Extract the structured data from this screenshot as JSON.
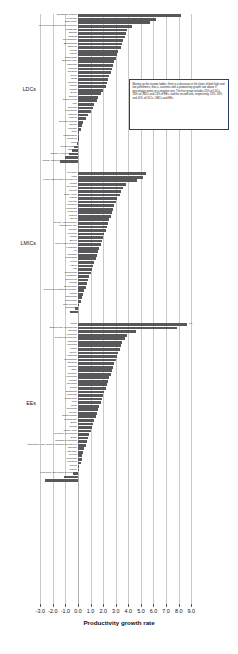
{
  "chart_data": {
    "type": "bar",
    "title": "",
    "xlabel": "Productivity growth rate",
    "ylabel": "",
    "xlim": [
      -3.0,
      9.0
    ],
    "grid": true,
    "orientation": "horizontal",
    "bar_color": "#58585a",
    "tick_labels": [
      "-3.0",
      "-2.0",
      "-1.0",
      "0.0",
      "1.0",
      "2.0",
      "3.0",
      "4.0",
      "5.0",
      "6.0",
      "7.0",
      "8.0",
      "9.0"
    ],
    "ticks": [
      -3,
      -2,
      -1,
      0,
      1,
      2,
      3,
      4,
      5,
      6,
      7,
      8,
      9
    ],
    "groups": [
      {
        "name": "LDCs",
        "categories": [
          "Equatorial Guinea",
          "Myanmar",
          "East Timor",
          "Lao People's Democratic Republic",
          "Cambodia",
          "Bhutan",
          "Uganda",
          "Mozambique",
          "Bangladesh",
          "Ethiopia",
          "Angola",
          "Liberia",
          "Afghanistan",
          "Burkina Faso",
          "Tanzania",
          "Lesotho",
          "Rwanda",
          "Nepal",
          "Chad",
          "Somalia",
          "Sudan",
          "Malawi",
          "Benin",
          "Zambia",
          "Sierra Leone",
          "Mali",
          "Senegal",
          "Mauritania",
          "Gambia",
          "Guinea",
          "Solomon Islands",
          "Eritrea",
          "Vanuatu",
          "Togo",
          "Madagascar",
          "Comoros",
          "Niger",
          "Guinea-Bissau",
          "Burundi",
          "Central African Republic",
          "Haiti",
          "Congo, Democratic Republic of"
        ],
        "values": [
          8.2,
          6.2,
          5.7,
          4.3,
          3.9,
          3.8,
          3.7,
          3.6,
          3.5,
          3.4,
          3.2,
          3.1,
          3.0,
          2.9,
          2.8,
          2.7,
          2.6,
          2.5,
          2.4,
          2.3,
          2.2,
          2.0,
          1.8,
          1.6,
          1.5,
          1.3,
          1.2,
          1.0,
          0.8,
          0.6,
          0.4,
          0.3,
          0.2,
          0.1,
          0.1,
          0.0,
          -0.1,
          -0.3,
          -0.5,
          -0.7,
          -1.0,
          -1.4
        ],
        "value_labels": []
      },
      {
        "name": "LMICs",
        "categories": [
          "Viet Nam",
          "India",
          "Korea, Democratic Republic of",
          "Albania",
          "Sri Lanka",
          "Armenia",
          "Cabo Verde",
          "Ghana",
          "Guyana",
          "Mongolia",
          "Indonesia",
          "Moldova",
          "Nigeria",
          "Egypt",
          "Syrian Arab Republic",
          "Philippines, The",
          "Ukraine",
          "Morocco",
          "Sudan",
          "Bolivia",
          "Papua New Guinea",
          "Honduras",
          "Fiji",
          "Pakistan",
          "Nicaragua",
          "Kenya",
          "Algeria",
          "Iraq",
          "Guatemala",
          "Paraguay",
          "Cameroon",
          "Jordan",
          "El Salvador",
          "Occupied Palestinian Territory",
          "Congo",
          "Swaziland",
          "Cameroon",
          "Côte d'Ivoire",
          "Zimbabwe",
          "Yemen"
        ],
        "values": [
          5.4,
          5.2,
          4.7,
          3.8,
          3.6,
          3.4,
          3.3,
          3.1,
          3.0,
          2.9,
          2.8,
          2.7,
          2.6,
          2.5,
          2.4,
          2.3,
          2.2,
          2.1,
          2.0,
          1.9,
          1.8,
          1.7,
          1.6,
          1.5,
          1.4,
          1.3,
          1.2,
          1.1,
          1.0,
          0.9,
          0.8,
          0.7,
          0.6,
          0.5,
          0.4,
          0.3,
          0.2,
          0.1,
          -0.2,
          -0.6
        ],
        "value_labels": []
      },
      {
        "name": "EEs",
        "categories": [
          "China",
          "Bosnia and Herzegovina",
          "Belarus",
          "Mauritius",
          "Dominican Republic",
          "Thailand",
          "Malaysia",
          "Latvia",
          "Turkey",
          "Argentina",
          "Kazakhstan",
          "Bulgaria",
          "Panama",
          "Chile",
          "Uruguay",
          "Azerbaijan",
          "Tunisia",
          "Romania",
          "Serbia",
          "Botswana",
          "Lithuania",
          "Costa Rica",
          "Peru",
          "Cuba",
          "Colombia",
          "Mexico",
          "Turkmenistan",
          "Montenegro",
          "Brazil",
          "Jordan",
          "South Africa",
          "Republic of Moldova",
          "Brazil",
          "Russian Federation",
          "Macedonia, The former Yugoslav Republic of",
          "Jamaica",
          "Ecuador",
          "Mexico",
          "Colombia",
          "Lebanon",
          "Serbia",
          "Gabon",
          "Venezuela, Bolivarian Republic of",
          "Algeria",
          "Libyan Arab Jamahiriya"
        ],
        "values": [
          8.7,
          7.9,
          4.6,
          3.9,
          3.7,
          3.5,
          3.4,
          3.3,
          3.2,
          3.1,
          3.0,
          2.9,
          2.8,
          2.7,
          2.6,
          2.5,
          2.4,
          2.3,
          2.2,
          2.1,
          2.0,
          1.9,
          1.8,
          1.7,
          1.6,
          1.5,
          1.4,
          1.3,
          1.2,
          1.1,
          1.0,
          0.9,
          0.8,
          0.7,
          0.6,
          0.5,
          0.4,
          0.35,
          0.3,
          0.2,
          0.1,
          0.05,
          -0.4,
          -1.1,
          -2.6
        ],
        "value_labels": [
          {
            "category": "China",
            "label": "8.7"
          }
        ]
      }
    ]
  },
  "annotation": {
    "text": "Moving up the income ladder, there is a decrease in the share of both high and low performers, that is, countries with a productivity growth rate above 3 percentage points or a negative one. The first group includes 20% of LDCs, 18% of LMICs and 13% of EEs, and the second one, respectively, 23%, 18% and 10% of LDCs, LMICs and EEs."
  }
}
